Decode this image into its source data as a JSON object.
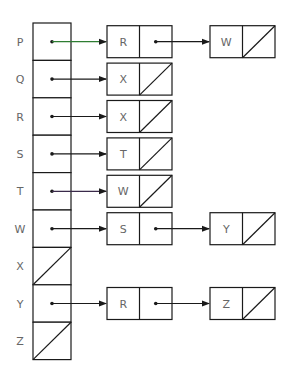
{
  "diagram": {
    "type": "adjacency-list",
    "colors": {
      "stroke": "#1a1a1a",
      "text": "#666666",
      "arrow_default": "#1a1a1a",
      "arrow_p": "#2e7d32",
      "arrow_t": "#3a2a4a"
    },
    "rows": [
      {
        "vertex": "P",
        "list": [
          "R",
          "W"
        ],
        "arrow_color": "#2e7d32"
      },
      {
        "vertex": "Q",
        "list": [
          "X"
        ]
      },
      {
        "vertex": "R",
        "list": [
          "X"
        ]
      },
      {
        "vertex": "S",
        "list": [
          "T"
        ]
      },
      {
        "vertex": "T",
        "list": [
          "W"
        ],
        "arrow_color": "#3a2a4a"
      },
      {
        "vertex": "W",
        "list": [
          "S",
          "Y"
        ]
      },
      {
        "vertex": "X",
        "list": []
      },
      {
        "vertex": "Y",
        "list": [
          "R",
          "Z"
        ]
      },
      {
        "vertex": "Z",
        "list": []
      }
    ]
  }
}
